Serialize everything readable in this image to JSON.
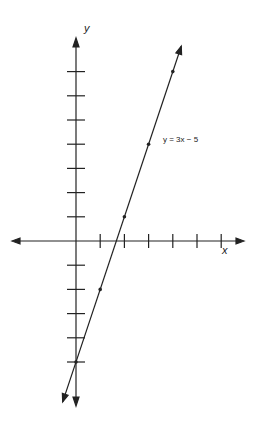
{
  "chart_data": {
    "type": "line",
    "title": "",
    "xlabel": "x",
    "ylabel": "y",
    "annotation": "y = 3x − 5",
    "equation": {
      "slope": 3,
      "intercept": -5
    },
    "x": [
      0,
      1,
      2,
      3,
      4
    ],
    "values": [
      -5,
      -2,
      1,
      4,
      7
    ],
    "series": [
      {
        "name": "y = 3x − 5",
        "x": [
          0,
          1,
          2,
          3,
          4
        ],
        "y": [
          -5,
          -2,
          1,
          4,
          7
        ]
      }
    ],
    "xlim": [
      -3,
      7
    ],
    "ylim": [
      -6,
      8
    ],
    "x_ticks": [
      1,
      2,
      3,
      4,
      5,
      6
    ],
    "y_ticks": [
      -5,
      -4,
      -3,
      -2,
      -1,
      1,
      2,
      3,
      4,
      5,
      6,
      7
    ],
    "grid": false,
    "legend": "none"
  },
  "labels": {
    "x_axis": "x",
    "y_axis": "y",
    "line_label": "y = 3x − 5"
  }
}
